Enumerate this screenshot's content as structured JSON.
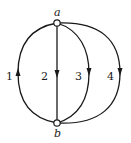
{
  "diagram": {
    "type": "graph",
    "nodes": [
      {
        "id": "a",
        "label": "a"
      },
      {
        "id": "b",
        "label": "b"
      }
    ],
    "edges": [
      {
        "id": "1",
        "label": "1",
        "from": "b",
        "to": "a",
        "direction": "up"
      },
      {
        "id": "2",
        "label": "2",
        "from": "a",
        "to": "b",
        "direction": "down"
      },
      {
        "id": "3",
        "label": "3",
        "from": "a",
        "to": "b",
        "direction": "down"
      },
      {
        "id": "4",
        "label": "4",
        "from": "a",
        "to": "b",
        "direction": "down"
      }
    ]
  }
}
